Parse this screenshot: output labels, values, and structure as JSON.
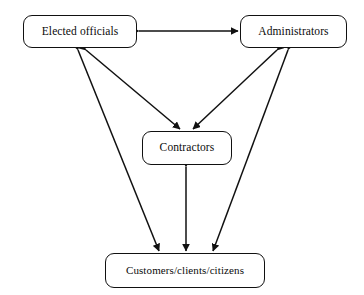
{
  "diagram": {
    "background_color": "#ffffff",
    "line_color": "#111111",
    "text_color": "#0b0b0b",
    "nodes": [
      {
        "id": "elected",
        "label": "Elected officials",
        "shape": "rounded-rectangle"
      },
      {
        "id": "admins",
        "label": "Administrators",
        "shape": "rounded-rectangle"
      },
      {
        "id": "contract",
        "label": "Contractors",
        "shape": "rounded-rectangle"
      },
      {
        "id": "customers",
        "label": "Customers/clients/citizens",
        "shape": "rounded-rectangle"
      }
    ],
    "edges": [
      {
        "id": "elected-admins",
        "from": "elected",
        "to": "admins",
        "direction": "bidirectional",
        "label": ""
      },
      {
        "id": "elected-contract",
        "from": "elected",
        "to": "contract",
        "direction": "bidirectional",
        "label": ""
      },
      {
        "id": "elected-customers",
        "from": "elected",
        "to": "customers",
        "direction": "bidirectional",
        "label": ""
      },
      {
        "id": "admins-contract",
        "from": "admins",
        "to": "contract",
        "direction": "bidirectional",
        "label": ""
      },
      {
        "id": "admins-customers",
        "from": "admins",
        "to": "customers",
        "direction": "bidirectional",
        "label": ""
      },
      {
        "id": "contract-customers",
        "from": "contract",
        "to": "customers",
        "direction": "bidirectional",
        "label": ""
      }
    ]
  }
}
